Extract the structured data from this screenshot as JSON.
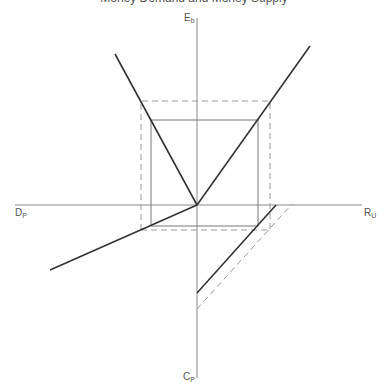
{
  "title_cut": "Money Demand and Money Supply",
  "axes": {
    "top": {
      "main": "E",
      "sub": "b"
    },
    "left": {
      "main": "D",
      "sub": "P"
    },
    "right": {
      "main": "R",
      "sub": "U"
    },
    "bottom": {
      "main": "C",
      "sub": "P"
    }
  },
  "colors": {
    "axis": "#888888",
    "line": "#333333",
    "dash": "#999999"
  }
}
